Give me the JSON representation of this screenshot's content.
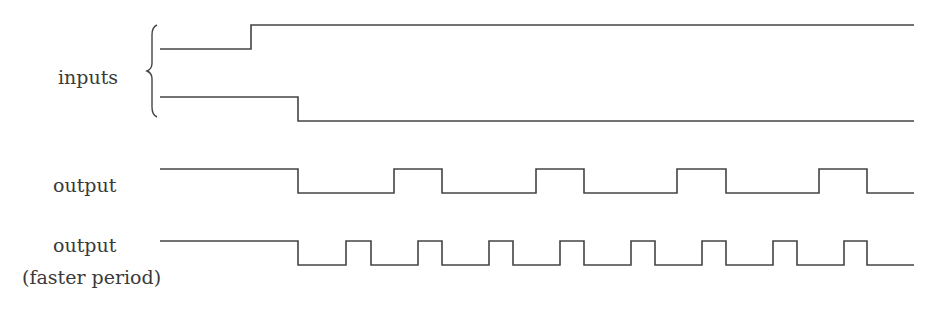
{
  "labels": {
    "inputs": "inputs",
    "output": "output",
    "output_fast": "output",
    "output_fast_note": "(faster period)"
  },
  "colors": {
    "line": "#444444",
    "background": "#ffffff"
  },
  "signals": [
    {
      "name": "input-1",
      "high_y": 25,
      "low_y": 49,
      "points": [
        [
          160,
          49
        ],
        [
          251,
          49
        ],
        [
          251,
          25
        ],
        [
          914,
          25
        ]
      ]
    },
    {
      "name": "input-2",
      "high_y": 97,
      "low_y": 121,
      "points": [
        [
          160,
          97
        ],
        [
          298,
          97
        ],
        [
          298,
          121
        ],
        [
          914,
          121
        ]
      ]
    },
    {
      "name": "output",
      "high_y": 169,
      "low_y": 193,
      "points": [
        [
          160,
          169
        ],
        [
          298,
          169
        ],
        [
          298,
          193
        ],
        [
          394,
          193
        ],
        [
          394,
          169
        ],
        [
          442,
          169
        ],
        [
          442,
          193
        ],
        [
          536,
          193
        ],
        [
          536,
          169
        ],
        [
          584,
          169
        ],
        [
          584,
          193
        ],
        [
          677,
          193
        ],
        [
          677,
          169
        ],
        [
          726,
          169
        ],
        [
          726,
          193
        ],
        [
          819,
          193
        ],
        [
          819,
          169
        ],
        [
          867,
          169
        ],
        [
          867,
          193
        ],
        [
          914,
          193
        ]
      ]
    },
    {
      "name": "output-faster-period",
      "high_y": 241,
      "low_y": 265,
      "points": [
        [
          160,
          241
        ],
        [
          298,
          241
        ],
        [
          298,
          265
        ],
        [
          346,
          265
        ],
        [
          346,
          241
        ],
        [
          371,
          241
        ],
        [
          371,
          265
        ],
        [
          418,
          265
        ],
        [
          418,
          241
        ],
        [
          442,
          241
        ],
        [
          442,
          265
        ],
        [
          489,
          265
        ],
        [
          489,
          241
        ],
        [
          513,
          241
        ],
        [
          513,
          265
        ],
        [
          560,
          265
        ],
        [
          560,
          241
        ],
        [
          584,
          241
        ],
        [
          584,
          265
        ],
        [
          631,
          265
        ],
        [
          631,
          241
        ],
        [
          655,
          241
        ],
        [
          655,
          265
        ],
        [
          702,
          265
        ],
        [
          702,
          241
        ],
        [
          726,
          241
        ],
        [
          726,
          265
        ],
        [
          773,
          265
        ],
        [
          773,
          241
        ],
        [
          797,
          241
        ],
        [
          797,
          265
        ],
        [
          844,
          265
        ],
        [
          844,
          241
        ],
        [
          867,
          241
        ],
        [
          867,
          265
        ],
        [
          914,
          265
        ]
      ]
    }
  ],
  "brace": {
    "x": 152,
    "top": 25,
    "bottom": 117
  }
}
